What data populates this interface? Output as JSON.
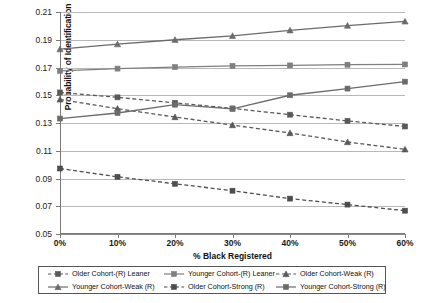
{
  "chart_data": {
    "type": "line",
    "title": "",
    "xlabel": "% Black Registered",
    "ylabel": "Probability of Identification",
    "categories": [
      "0%",
      "10%",
      "20%",
      "30%",
      "40%",
      "50%",
      "60%"
    ],
    "x": [
      0,
      10,
      20,
      30,
      40,
      50,
      60
    ],
    "ylim": [
      0.05,
      0.21
    ],
    "yticks": [
      "0.05",
      "0.07",
      "0.09",
      "0.11",
      "0.13",
      "0.15",
      "0.17",
      "0.19",
      "0.21"
    ],
    "ytick_values": [
      0.05,
      0.07,
      0.09,
      0.11,
      0.13,
      0.15,
      0.17,
      0.19,
      0.21
    ],
    "grid": "horizontal",
    "legend_position": "bottom",
    "series": [
      {
        "name": "Older Cohort-(R) Leaner",
        "values": [
          0.152,
          0.1485,
          0.1445,
          0.1405,
          0.136,
          0.1315,
          0.1275
        ],
        "style": "dashed",
        "marker": "square",
        "color": "#595959"
      },
      {
        "name": "Younger Cohort-(R) Leaner",
        "values": [
          0.1675,
          0.1692,
          0.1703,
          0.1712,
          0.1715,
          0.172,
          0.1722
        ],
        "style": "solid",
        "marker": "square",
        "color": "#7f7f7f"
      },
      {
        "name": "Older Cohort-Weak (R)",
        "values": [
          0.147,
          0.1403,
          0.1343,
          0.1285,
          0.1228,
          0.1163,
          0.111
        ],
        "style": "dashed",
        "marker": "triangle",
        "color": "#595959"
      },
      {
        "name": "Younger Cohort-Weak (R)",
        "values": [
          0.1832,
          0.1868,
          0.19,
          0.1928,
          0.1968,
          0.2002,
          0.2032
        ],
        "style": "solid",
        "marker": "triangle",
        "color": "#6b6b6b"
      },
      {
        "name": "Older Cohort-Strong (R)",
        "values": [
          0.0972,
          0.0912,
          0.0862,
          0.0812,
          0.0755,
          0.0712,
          0.0668
        ],
        "style": "dashed",
        "marker": "square",
        "color": "#4d4d4d"
      },
      {
        "name": "Younger Cohort-Strong (R)",
        "values": [
          0.1332,
          0.1372,
          0.1432,
          0.1402,
          0.15,
          0.1548,
          0.1598
        ],
        "style": "solid",
        "marker": "square",
        "color": "#6b6b6b"
      }
    ]
  },
  "legend": {
    "items": [
      {
        "label": "Older Cohort-(R) Leaner"
      },
      {
        "label": "Younger Cohort-(R) Leaner"
      },
      {
        "label": "Older Cohort-Weak (R)"
      },
      {
        "label": "Younger Cohort-Weak (R)"
      },
      {
        "label": "Older Cohort-Strong (R)"
      },
      {
        "label": "Younger Cohort-Strong (R)"
      }
    ]
  },
  "colors": {
    "grid": "#b8b8b8",
    "axis": "#7a7a7a",
    "text": "#1a1a1a",
    "background": "#ffffff"
  }
}
